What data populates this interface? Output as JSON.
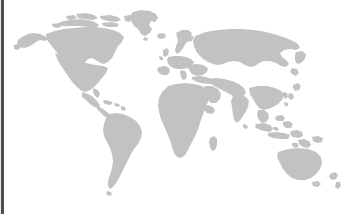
{
  "canvas": {
    "width": 347,
    "height": 214,
    "background_color": "#ffffff"
  },
  "map": {
    "title": "World Map",
    "projection": "equirectangular",
    "land_color": "#c2c2c2",
    "ocean_color": "#ffffff",
    "border_color": "#4e4e4e",
    "view_box": "0 0 347 214",
    "regions": [
      {
        "name": "north-america",
        "label": "North America"
      },
      {
        "name": "greenland",
        "label": "Greenland"
      },
      {
        "name": "south-america",
        "label": "South America"
      },
      {
        "name": "europe",
        "label": "Europe"
      },
      {
        "name": "africa",
        "label": "Africa"
      },
      {
        "name": "asia",
        "label": "Asia"
      },
      {
        "name": "southeast-asia-islands",
        "label": "Southeast Asia Islands"
      },
      {
        "name": "australia",
        "label": "Australia"
      },
      {
        "name": "new-zealand",
        "label": "New Zealand"
      },
      {
        "name": "iceland",
        "label": "Iceland"
      },
      {
        "name": "united-kingdom",
        "label": "United Kingdom"
      },
      {
        "name": "japan",
        "label": "Japan"
      },
      {
        "name": "madagascar",
        "label": "Madagascar"
      },
      {
        "name": "caribbean",
        "label": "Caribbean"
      }
    ]
  },
  "chrome": {
    "left_bar_label": "Left edge bar",
    "left_bar_color": "#4e4e4e",
    "left_bar_width": 3
  }
}
